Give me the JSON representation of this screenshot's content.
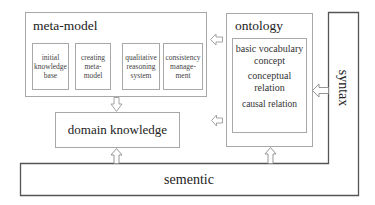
{
  "diagram": {
    "meta_model": {
      "title": "meta-model",
      "components": [
        {
          "label": "initial knowledge base"
        },
        {
          "label": "creating meta-model"
        },
        {
          "label": "qualitative reasoning system"
        },
        {
          "label": "consistency manage-ment"
        }
      ]
    },
    "ontology": {
      "title": "ontology",
      "items": [
        {
          "label": "basic vocabulary concept"
        },
        {
          "label": "conceptual relation"
        },
        {
          "label": "causal relation"
        }
      ]
    },
    "domain_knowledge": {
      "label": "domain knowledge"
    },
    "syntax": {
      "label": "syntax"
    },
    "semantic": {
      "label": "sementic"
    },
    "arrows": [
      {
        "from": "ontology",
        "to": "meta-model",
        "direction": "left"
      },
      {
        "from": "meta-model",
        "to": "domain knowledge",
        "direction": "down"
      },
      {
        "from": "ontology",
        "to": "domain knowledge",
        "direction": "left"
      },
      {
        "from": "syntax",
        "to": "ontology",
        "direction": "left"
      },
      {
        "from": "sementic",
        "to": "domain knowledge",
        "direction": "up"
      },
      {
        "from": "sementic",
        "to": "ontology",
        "direction": "up"
      }
    ],
    "colors": {
      "border_light": "#a8a8a8",
      "border_dark": "#555555",
      "text": "#222222"
    }
  }
}
